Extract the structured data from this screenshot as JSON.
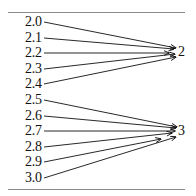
{
  "diagram": {
    "type": "many-to-one mapping (rounding)",
    "sources": [
      "2.0",
      "2.1",
      "2.2",
      "2.3",
      "2.4",
      "2.5",
      "2.6",
      "2.7",
      "2.8",
      "2.9",
      "3.0"
    ],
    "targets": [
      "2",
      "3"
    ],
    "mappings": [
      {
        "from": "2.0",
        "to": "2"
      },
      {
        "from": "2.1",
        "to": "2"
      },
      {
        "from": "2.2",
        "to": "2"
      },
      {
        "from": "2.3",
        "to": "2"
      },
      {
        "from": "2.4",
        "to": "2"
      },
      {
        "from": "2.5",
        "to": "3"
      },
      {
        "from": "2.6",
        "to": "3"
      },
      {
        "from": "2.7",
        "to": "3"
      },
      {
        "from": "2.8",
        "to": "3"
      },
      {
        "from": "2.9",
        "to": "3"
      },
      {
        "from": "3.0",
        "to": "3"
      }
    ]
  },
  "labels": {
    "s0": "2.0",
    "s1": "2.1",
    "s2": "2.2",
    "s3": "2.3",
    "s4": "2.4",
    "s5": "2.5",
    "s6": "2.6",
    "s7": "2.7",
    "s8": "2.8",
    "s9": "2.9",
    "s10": "3.0",
    "t0": "2",
    "t1": "3"
  },
  "colors": {
    "line": "#111111",
    "rule": "#8a8a8a",
    "background": "#ffffff"
  }
}
